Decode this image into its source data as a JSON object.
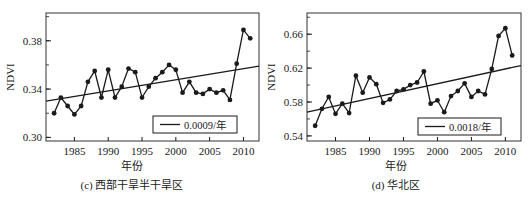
{
  "chart_data": [
    {
      "type": "line",
      "panel_id": "c",
      "caption": "(c) 西部干旱半干旱区",
      "xlabel": "年份",
      "ylabel": "NDVI",
      "x": [
        1982,
        1983,
        1984,
        1985,
        1986,
        1987,
        1988,
        1989,
        1990,
        1991,
        1992,
        1993,
        1994,
        1995,
        1996,
        1997,
        1998,
        1999,
        2000,
        2001,
        2002,
        2003,
        2004,
        2005,
        2006,
        2007,
        2008,
        2009,
        2010,
        2011
      ],
      "series": [
        {
          "name": "NDVI",
          "values": [
            0.32,
            0.333,
            0.326,
            0.319,
            0.326,
            0.346,
            0.355,
            0.333,
            0.356,
            0.333,
            0.342,
            0.357,
            0.354,
            0.333,
            0.342,
            0.349,
            0.354,
            0.36,
            0.356,
            0.337,
            0.346,
            0.337,
            0.336,
            0.34,
            0.337,
            0.339,
            0.331,
            0.361,
            0.389,
            0.382
          ]
        },
        {
          "name": "0.0009/年",
          "type": "trend",
          "x": [
            1980.8,
            2012.3
          ],
          "values": [
            0.33,
            0.359
          ]
        }
      ],
      "legend": [
        "0.0009/年"
      ],
      "legend_position": "lower right",
      "xticks": [
        1985,
        1990,
        1995,
        2000,
        2005,
        2010
      ],
      "yticks": [
        0.3,
        0.34,
        0.38
      ],
      "ytick_labels": [
        "0.30",
        "0.34",
        "0.38"
      ],
      "yminor_step": 0.02,
      "xlim": [
        1980.8,
        2012.3
      ],
      "ylim": [
        0.297,
        0.403
      ],
      "grid": false
    },
    {
      "type": "line",
      "panel_id": "d",
      "caption": "(d) 华北区",
      "xlabel": "年份",
      "ylabel": "NDVI",
      "x": [
        1982,
        1983,
        1984,
        1985,
        1986,
        1987,
        1988,
        1989,
        1990,
        1991,
        1992,
        1993,
        1994,
        1995,
        1996,
        1997,
        1998,
        1999,
        2000,
        2001,
        2002,
        2003,
        2004,
        2005,
        2006,
        2007,
        2008,
        2009,
        2010,
        2011
      ],
      "series": [
        {
          "name": "NDVI",
          "values": [
            0.552,
            0.572,
            0.586,
            0.566,
            0.578,
            0.567,
            0.611,
            0.591,
            0.609,
            0.601,
            0.579,
            0.583,
            0.593,
            0.595,
            0.6,
            0.603,
            0.616,
            0.578,
            0.582,
            0.568,
            0.587,
            0.593,
            0.602,
            0.586,
            0.593,
            0.589,
            0.619,
            0.658,
            0.667,
            0.635
          ]
        },
        {
          "name": "0.0018/年",
          "type": "trend",
          "x": [
            1980.8,
            2012.3
          ],
          "values": [
            0.568,
            0.623
          ]
        }
      ],
      "legend": [
        "0.0018/年"
      ],
      "legend_position": "lower right",
      "xticks": [
        1985,
        1990,
        1995,
        2000,
        2005,
        2010
      ],
      "yticks": [
        0.54,
        0.58,
        0.62,
        0.66
      ],
      "ytick_labels": [
        "0.54",
        "0.58",
        "0.62",
        "0.66"
      ],
      "yminor_step": 0.02,
      "xlim": [
        1980.8,
        2012.3
      ],
      "ylim": [
        0.534,
        0.685
      ],
      "grid": false
    }
  ],
  "layout": {
    "panels": [
      {
        "left": 0,
        "plot": {
          "x0": 46,
          "y0": 13,
          "x1": 259,
          "y1": 141
        },
        "legend_box": {
          "x": 153,
          "y": 116,
          "w": 84,
          "h": 17
        }
      },
      {
        "left": 264,
        "plot": {
          "x0": 43,
          "y0": 13,
          "x1": 257,
          "y1": 141
        },
        "legend_box": {
          "x": 154,
          "y": 118,
          "w": 83,
          "h": 17
        }
      }
    ],
    "colors": {
      "line": "#1a1a1a",
      "frame": "#333333",
      "background": "#ffffff"
    }
  }
}
